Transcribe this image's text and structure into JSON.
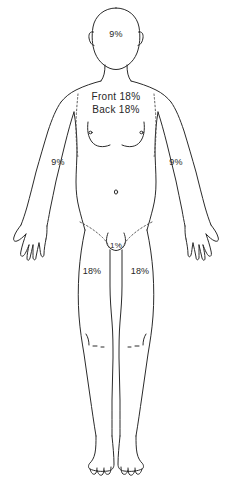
{
  "diagram": {
    "figure": "anterior full-body human outline",
    "line_color": "#2b2b2b",
    "text_color": "#262626",
    "background_color": "#ffffff"
  },
  "labels": {
    "head": "9%",
    "torso_front": "Front 18%",
    "torso_back": "Back 18%",
    "left_arm": "9%",
    "right_arm": "9%",
    "genitalia": "1%",
    "left_leg": "18%",
    "right_leg": "18%"
  }
}
